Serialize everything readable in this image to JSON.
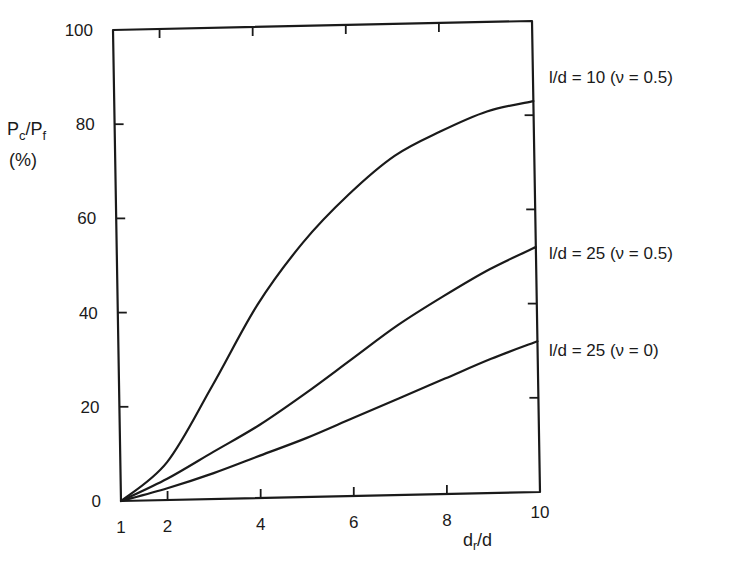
{
  "chart_data": {
    "type": "line",
    "title": "",
    "xlabel": "d_r/d",
    "ylabel": "P_c/P_f (%)",
    "xlim": [
      1,
      10
    ],
    "ylim": [
      0,
      100
    ],
    "grid": false,
    "legend_position": "right-inline",
    "x_ticks": [
      1,
      2,
      4,
      6,
      8,
      10
    ],
    "y_ticks": [
      0,
      20,
      40,
      60,
      80,
      100
    ],
    "x": [
      1,
      2,
      3,
      4,
      5,
      6,
      7,
      8,
      9,
      10
    ],
    "series": [
      {
        "name": "l/d = 10 (ν = 0.5)",
        "values": [
          0,
          8,
          24,
          41,
          54,
          64,
          72,
          77,
          81,
          83
        ]
      },
      {
        "name": "l/d = 25 (ν = 0.5)",
        "values": [
          0,
          4.5,
          10,
          15.5,
          22,
          29,
          36,
          42,
          47.5,
          52
        ]
      },
      {
        "name": "l/d = 25 (ν = 0)",
        "values": [
          0,
          2.5,
          5.5,
          9,
          12.5,
          16.5,
          20.5,
          24.5,
          28.5,
          32
        ]
      }
    ]
  },
  "labels": {
    "y_axis_main": "P",
    "y_axis_sub1": "c",
    "y_axis_slash": "/P",
    "y_axis_sub2": "f",
    "y_axis_unit": "(%)",
    "x_axis_main": "d",
    "x_axis_sub": "r",
    "x_axis_rest": "/d",
    "series_0": "l/d = 10  (ν = 0.5)",
    "series_1": "l/d = 25  (ν = 0.5)",
    "series_2": "l/d = 25  (ν = 0)"
  },
  "y_tick_labels": [
    "0",
    "20",
    "40",
    "60",
    "80",
    "100"
  ],
  "x_tick_labels": [
    "1",
    "2",
    "4",
    "6",
    "8",
    "10"
  ]
}
